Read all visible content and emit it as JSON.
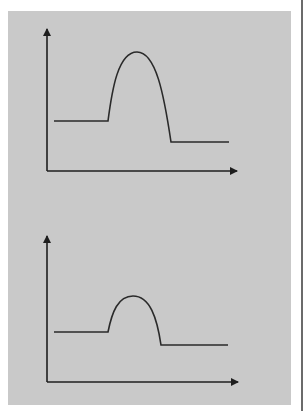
{
  "figure": {
    "background_color": "#c9c9c9",
    "line_color": "#2a2a2a",
    "panels": [
      {
        "name": "top-graph",
        "description": "Energy-profile style curve with tall peak",
        "baseline_left_level": "high",
        "peak": "tall",
        "baseline_right_level": "low"
      },
      {
        "name": "bottom-graph",
        "description": "Energy-profile style curve with short peak",
        "baseline_left_level": "high",
        "peak": "short",
        "baseline_right_level": "low"
      }
    ]
  }
}
